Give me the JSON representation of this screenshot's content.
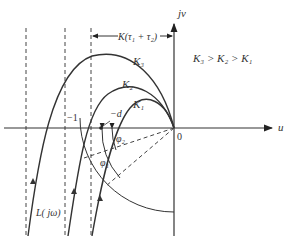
{
  "diagram": {
    "type": "nyquist-plot",
    "axes": {
      "x_label": "u",
      "y_label": "jv",
      "origin_label": "0"
    },
    "labels": {
      "minus_one": "−1",
      "minus_d": "−d",
      "bracket": "K(τ₁ + τ₂)",
      "relation": "K₃ > K₂ > K₁",
      "curve_label": "L( jω)",
      "phi1": "φ₁",
      "phi2": "φ₂"
    },
    "curves": [
      {
        "name": "K3",
        "label": "K₃"
      },
      {
        "name": "K2",
        "label": "K₂"
      },
      {
        "name": "K1",
        "label": "K₁"
      }
    ],
    "colors": {
      "line": "#333333",
      "background": "#ffffff"
    }
  }
}
